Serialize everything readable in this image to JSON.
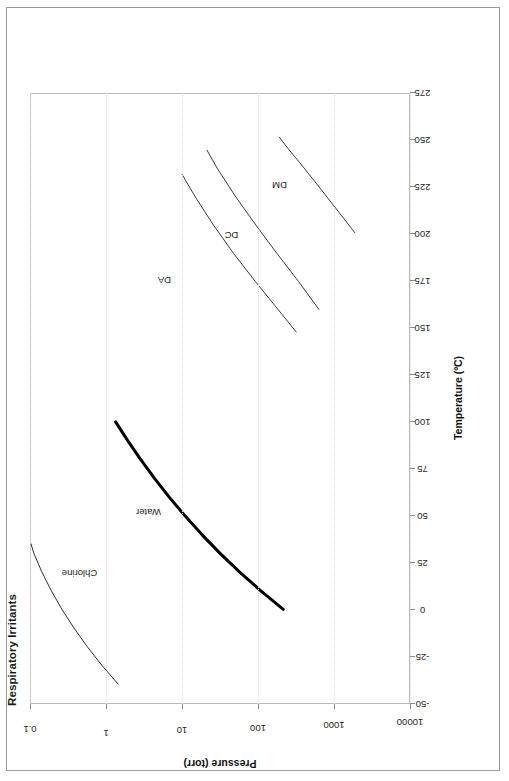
{
  "figure": {
    "title": "Respiratory Irritants",
    "orientation": "rotated-90-ccw",
    "frame_border_color": "#9a9a9a"
  },
  "axis_titles": {
    "x": "Temperature (ºC)",
    "y": "Pressure (torr)"
  },
  "ticks": {
    "x": [
      "-50",
      "-25",
      "0",
      "25",
      "50",
      "75",
      "100",
      "125",
      "150",
      "175",
      "200",
      "225",
      "250",
      "275"
    ],
    "y": [
      "10000",
      "1000",
      "100",
      "10",
      "1",
      "0.1"
    ]
  },
  "series_labels": {
    "chlorine": "Chlorine",
    "water": "Water",
    "da": "DA",
    "dc": "DC",
    "dm": "DM"
  },
  "chart_data": {
    "type": "line",
    "title": "Respiratory Irritants",
    "xlabel": "Temperature (ºC)",
    "ylabel": "Pressure (torr)",
    "xlim": [
      -50,
      275
    ],
    "ylim": [
      0.1,
      10000
    ],
    "yscale": "log",
    "grid": true,
    "legend": "inline-labels",
    "xticks": [
      -50,
      -25,
      0,
      25,
      50,
      75,
      100,
      125,
      150,
      175,
      200,
      225,
      250,
      275
    ],
    "yticks": [
      0.1,
      1,
      10,
      100,
      1000,
      10000
    ],
    "series": [
      {
        "name": "Chlorine",
        "color": "#2b2b2b",
        "width": 1,
        "label_at": {
          "x": 10,
          "y": 2600
        },
        "points": [
          {
            "x": -40,
            "y": 700
          },
          {
            "x": -30,
            "y": 1150
          },
          {
            "x": -20,
            "y": 1800
          },
          {
            "x": -10,
            "y": 2700
          },
          {
            "x": 0,
            "y": 3900
          },
          {
            "x": 10,
            "y": 5400
          },
          {
            "x": 20,
            "y": 7200
          },
          {
            "x": 30,
            "y": 9200
          },
          {
            "x": 35,
            "y": 10000
          }
        ]
      },
      {
        "name": "Water",
        "color": "#000000",
        "width": 3,
        "label_at": {
          "x": 45,
          "y": 330
        },
        "points": [
          {
            "x": 0,
            "y": 4.6
          },
          {
            "x": 10,
            "y": 9.2
          },
          {
            "x": 20,
            "y": 17.5
          },
          {
            "x": 30,
            "y": 31.8
          },
          {
            "x": 40,
            "y": 55.3
          },
          {
            "x": 50,
            "y": 92.5
          },
          {
            "x": 60,
            "y": 149.4
          },
          {
            "x": 70,
            "y": 233.7
          },
          {
            "x": 80,
            "y": 355.1
          },
          {
            "x": 90,
            "y": 525.8
          },
          {
            "x": 100,
            "y": 760.0
          }
        ]
      },
      {
        "name": "DA",
        "color": "#3a3a3a",
        "width": 1,
        "label_at": {
          "x": 172,
          "y": 200
        },
        "points": [
          {
            "x": 148,
            "y": 3.1
          },
          {
            "x": 160,
            "y": 5.4
          },
          {
            "x": 175,
            "y": 10.8
          },
          {
            "x": 190,
            "y": 21.0
          },
          {
            "x": 205,
            "y": 38.5
          },
          {
            "x": 220,
            "y": 67.0
          },
          {
            "x": 232,
            "y": 100.0
          }
        ]
      },
      {
        "name": "DC",
        "color": "#3a3a3a",
        "width": 1,
        "label_at": {
          "x": 196,
          "y": 26
        },
        "points": [
          {
            "x": 160,
            "y": 1.55
          },
          {
            "x": 175,
            "y": 2.9
          },
          {
            "x": 190,
            "y": 5.6
          },
          {
            "x": 205,
            "y": 10.6
          },
          {
            "x": 220,
            "y": 19.5
          },
          {
            "x": 235,
            "y": 34.0
          },
          {
            "x": 245,
            "y": 47.0
          }
        ]
      },
      {
        "name": "DM",
        "color": "#3a3a3a",
        "width": 1,
        "label_at": {
          "x": 222,
          "y": 6.2
        },
        "points": [
          {
            "x": 201,
            "y": 0.52
          },
          {
            "x": 212,
            "y": 0.85
          },
          {
            "x": 224,
            "y": 1.45
          },
          {
            "x": 236,
            "y": 2.5
          },
          {
            "x": 246,
            "y": 4.0
          },
          {
            "x": 252,
            "y": 5.2
          }
        ]
      }
    ]
  }
}
